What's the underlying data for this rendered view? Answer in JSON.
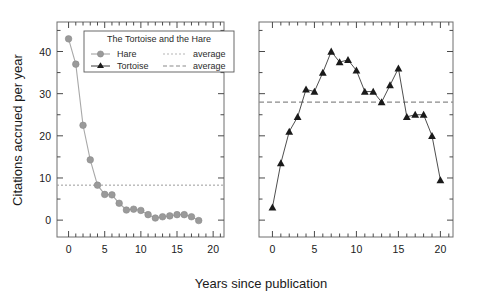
{
  "figure": {
    "background": "#ffffff",
    "axis_color": "#6e6e6e",
    "text_color": "#1a1a1a"
  },
  "axes": {
    "ylabel": "Citations accrued per year",
    "xlabel": "Years since publication",
    "yticks": [
      "0",
      "10",
      "20",
      "30",
      "40"
    ],
    "ytick_values": [
      0,
      10,
      20,
      30,
      40
    ],
    "xticks": [
      "0",
      "5",
      "10",
      "15",
      "20"
    ],
    "xtick_values": [
      0,
      5,
      10,
      15,
      20
    ],
    "ylim": [
      -4,
      47
    ],
    "xlim": [
      -1.6,
      21.5
    ],
    "grid": false
  },
  "legend": {
    "title": "The Tortoise and the Hare",
    "entries": [
      {
        "label": "Hare",
        "marker": "circle-marker",
        "color": "#9a9a9a",
        "avg_label": "average",
        "avg_style": "dotted"
      },
      {
        "label": "Tortoise",
        "marker": "triangle-marker",
        "color": "#1a1a1a",
        "avg_label": "average",
        "avg_style": "dashed"
      }
    ],
    "position": "upper-center-left-panel",
    "border_color": "#5a5a5a"
  },
  "chart_data": [
    {
      "type": "line",
      "panel": "left",
      "title": "",
      "xlabel": "Years since publication",
      "ylabel": "Citations accrued per year",
      "series_name": "Hare",
      "marker": "circle",
      "color": "#9a9a9a",
      "x": [
        0,
        1,
        2,
        3,
        4,
        5,
        6,
        7,
        8,
        9,
        10,
        11,
        12,
        13,
        14,
        15,
        16,
        17,
        18
      ],
      "values": [
        43.0,
        37.0,
        22.5,
        14.3,
        8.3,
        6.1,
        6.0,
        4.0,
        2.4,
        2.6,
        2.3,
        1.3,
        0.5,
        0.8,
        1.0,
        1.3,
        1.3,
        0.8,
        -0.1
      ],
      "average": 8.3,
      "average_label": "average",
      "average_style": "dotted",
      "average_color": "#9a9a9a",
      "xlim": [
        -1.6,
        21.5
      ],
      "ylim": [
        -4,
        47
      ],
      "xticks": [
        0,
        5,
        10,
        15,
        20
      ],
      "yticks": [
        0,
        10,
        20,
        30,
        40
      ],
      "grid": false
    },
    {
      "type": "line",
      "panel": "right",
      "title": "",
      "xlabel": "Years since publication",
      "ylabel": "",
      "series_name": "Tortoise",
      "marker": "triangle",
      "color": "#1a1a1a",
      "x": [
        0,
        1,
        2,
        3,
        4,
        5,
        6,
        7,
        8,
        9,
        10,
        11,
        12,
        13,
        14,
        15,
        16,
        17,
        18,
        19,
        20
      ],
      "values": [
        3.0,
        13.5,
        21.0,
        24.5,
        31.0,
        30.5,
        35.0,
        40.0,
        37.5,
        38.0,
        35.5,
        30.5,
        30.5,
        28.0,
        32.0,
        36.0,
        24.5,
        25.0,
        25.0,
        20.0,
        9.5
      ],
      "average": 28.0,
      "average_label": "average",
      "average_style": "dashed",
      "average_color": "#8a8a8a",
      "xlim": [
        -1.6,
        21.5
      ],
      "ylim": [
        -4,
        47
      ],
      "xticks": [
        0,
        5,
        10,
        15,
        20
      ],
      "yticks": [
        0,
        10,
        20,
        30,
        40
      ],
      "grid": false
    }
  ]
}
